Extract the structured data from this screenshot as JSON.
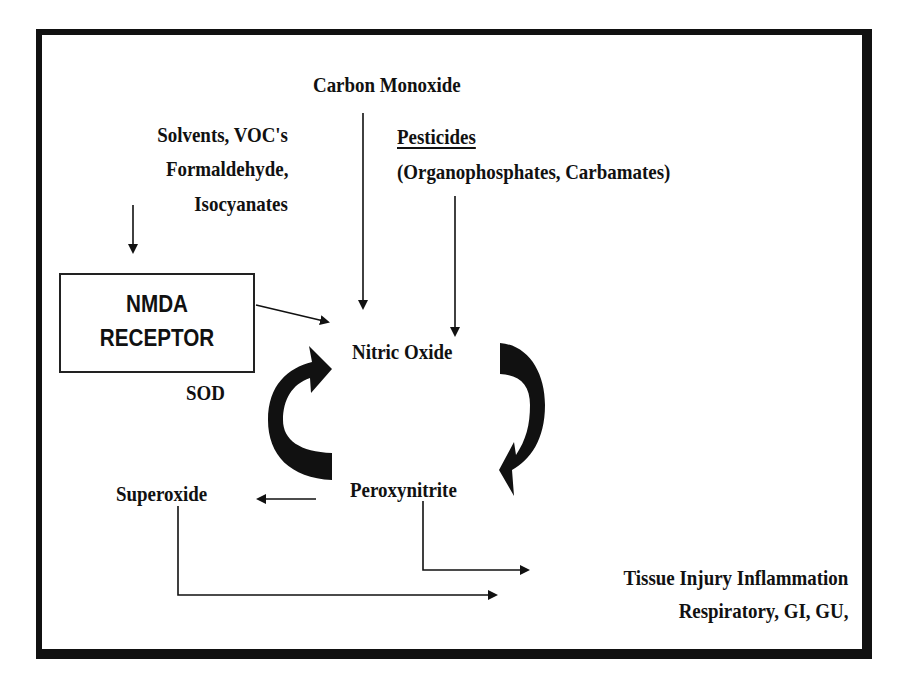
{
  "diagram": {
    "type": "flow",
    "nodes": {
      "carbon_monoxide": "Carbon Monoxide",
      "solvents": {
        "line1": "Solvents, VOC's",
        "line2": "Formaldehyde,",
        "line3": "Isocyanates"
      },
      "pesticides": {
        "title": "Pesticides",
        "subtitle": "(Organophosphates, Carbamates)"
      },
      "nmda": {
        "line1": "NMDA",
        "line2": "RECEPTOR"
      },
      "sod": "SOD",
      "nitric_oxide": "Nitric Oxide",
      "peroxynitrite": "Peroxynitrite",
      "superoxide": "Superoxide",
      "outcome": {
        "line1": "Tissue Injury Inflammation",
        "line2": "Respiratory, GI, GU,"
      }
    },
    "edges": [
      {
        "from": "Carbon Monoxide",
        "to": "Nitric Oxide"
      },
      {
        "from": "Pesticides",
        "to": "Nitric Oxide"
      },
      {
        "from": "Solvents, VOC's, Formaldehyde, Isocyanates",
        "to": "NMDA RECEPTOR"
      },
      {
        "from": "NMDA RECEPTOR",
        "to": "Nitric Oxide"
      },
      {
        "from": "Nitric Oxide",
        "to": "Peroxynitrite",
        "style": "curved-bold"
      },
      {
        "from": "Peroxynitrite",
        "to": "Nitric Oxide",
        "style": "curved-bold",
        "label": "SOD"
      },
      {
        "from": "Peroxynitrite",
        "to": "Superoxide"
      },
      {
        "from": "Peroxynitrite",
        "to": "Tissue Injury Inflammation"
      },
      {
        "from": "Superoxide",
        "to": "Tissue Injury Inflammation"
      }
    ],
    "colors": {
      "ink": "#111111",
      "background": "#ffffff"
    }
  }
}
